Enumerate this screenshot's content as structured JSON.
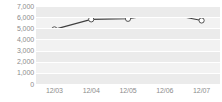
{
  "chart_data": {
    "type": "line",
    "title": "",
    "xlabel": "",
    "ylabel": "",
    "categories": [
      "12/03",
      "12/04",
      "12/05",
      "12/06",
      "12/07"
    ],
    "values": [
      4900,
      5800,
      5850,
      6350,
      5700
    ],
    "series": [
      {
        "name": "series-1",
        "values": [
          4900,
          5800,
          5850,
          6350,
          5700
        ]
      }
    ],
    "ylim": [
      0,
      7000
    ],
    "ytick_values": [
      0,
      1000,
      2000,
      3000,
      4000,
      5000,
      6000,
      7000
    ],
    "ytick_labels": [
      "0",
      "1,000",
      "2,000",
      "3,000",
      "4,000",
      "5,000",
      "6,000",
      "7,000"
    ],
    "grid": true,
    "grid_axis": "y",
    "legend": false,
    "legend_position": "none",
    "annotations": []
  },
  "style": {
    "line_color": "#404040",
    "marker_fill": "#ffffff",
    "marker_stroke": "#404040",
    "plot_background": "#f2f2f2",
    "band_color": "#ebebeb",
    "gridline_color": "#ffffff",
    "tick_label_color": "#8c8c8c",
    "page_background": "#ffffff"
  }
}
